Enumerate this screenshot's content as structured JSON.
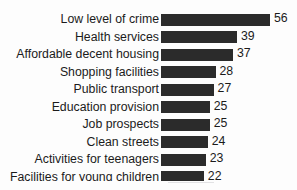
{
  "title_remnant": "",
  "colors": {
    "bar": "#2b2b2b",
    "text": "#1b1b1b",
    "background": "#fdfdfd"
  },
  "chart_data": {
    "type": "bar",
    "orientation": "horizontal",
    "title": "",
    "subtitle": "",
    "xlabel": "",
    "ylabel": "",
    "grid": false,
    "legend": false,
    "value_labels": true,
    "xlim": [
      0,
      56
    ],
    "categories": [
      "Low level of crime",
      "Health services",
      "Affordable decent housing",
      "Shopping facilities",
      "Public transport",
      "Education provision",
      "Job prospects",
      "Clean streets",
      "Activities for teenagers",
      "Facilities for young children"
    ],
    "values": [
      56,
      39,
      37,
      28,
      27,
      25,
      25,
      24,
      23,
      22
    ],
    "series": [
      {
        "name": "",
        "values": [
          56,
          39,
          37,
          28,
          27,
          25,
          25,
          24,
          23,
          22
        ]
      }
    ],
    "rows": [
      {
        "label": "Low level of crime",
        "value": 56,
        "value_text": "56"
      },
      {
        "label": "Health services",
        "value": 39,
        "value_text": "39"
      },
      {
        "label": "Affordable decent housing",
        "value": 37,
        "value_text": "37"
      },
      {
        "label": "Shopping facilities",
        "value": 28,
        "value_text": "28"
      },
      {
        "label": "Public transport",
        "value": 27,
        "value_text": "27"
      },
      {
        "label": "Education provision",
        "value": 25,
        "value_text": "25"
      },
      {
        "label": "Job prospects",
        "value": 25,
        "value_text": "25"
      },
      {
        "label": "Clean streets",
        "value": 24,
        "value_text": "24"
      },
      {
        "label": "Activities for teenagers",
        "value": 23,
        "value_text": "23"
      },
      {
        "label": "Facilities for young children",
        "value": 22,
        "value_text": "22"
      }
    ]
  }
}
